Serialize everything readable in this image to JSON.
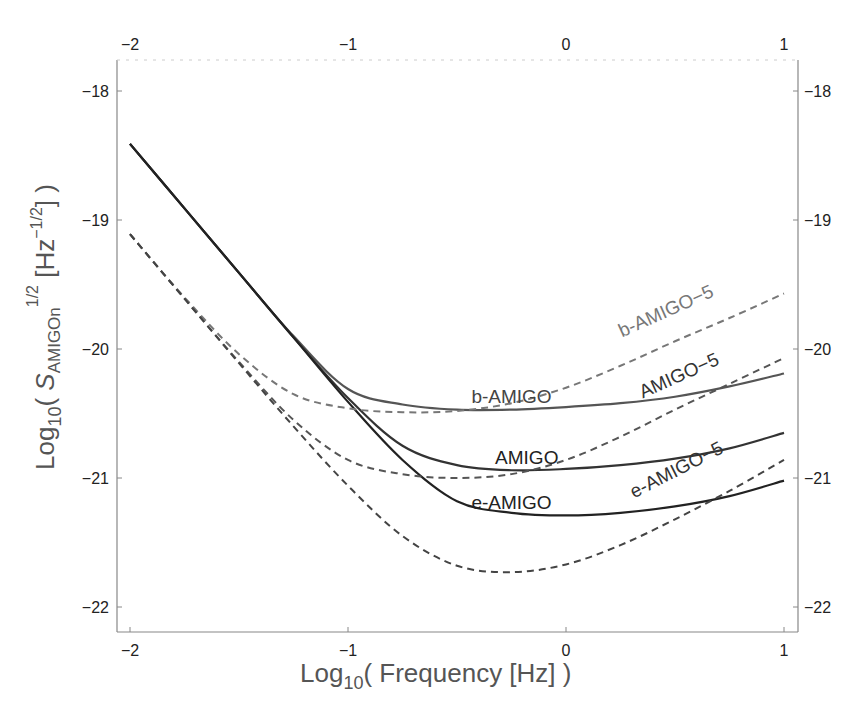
{
  "chart_data": {
    "type": "line",
    "title": "",
    "xlabel": "Log10( Frequency [Hz] )",
    "ylabel": "Log10( S_AMIGOn^1/2 [Hz^-1/2] )",
    "xlabel_parts": {
      "main": "Log",
      "sub": "10",
      "rest": "( Frequency [Hz] )"
    },
    "ylabel_parts": {
      "main": "Log",
      "sub": "10",
      "open": "( ",
      "s": "S",
      "s_sub": "AMIGOn",
      "s_sup": "1/2",
      "unit_open": " [Hz",
      "unit_sup": "−1/2",
      "close": "] )"
    },
    "xlim": [
      -2,
      1
    ],
    "ylim": [
      -22.2,
      -17.8
    ],
    "x_ticks": [
      -2,
      -1,
      0,
      1
    ],
    "x_tick_labels": [
      "−2",
      "−1",
      "0",
      "1"
    ],
    "y_ticks": [
      -18,
      -19,
      -20,
      -21,
      -22
    ],
    "y_tick_labels": [
      "−18",
      "−19",
      "−20",
      "−21",
      "−22"
    ],
    "grid": false,
    "legend": "inline labels",
    "x": [
      -2,
      -1.75,
      -1.5,
      -1.25,
      -1,
      -0.75,
      -0.5,
      -0.25,
      0,
      0.25,
      0.5,
      0.75,
      1
    ],
    "series": [
      {
        "name": "b-AMIGO",
        "style": "solid",
        "color": "#555555",
        "values": [
          -18.41,
          -18.91,
          -19.41,
          -19.9,
          -20.31,
          -20.43,
          -20.47,
          -20.47,
          -20.45,
          -20.42,
          -20.37,
          -20.29,
          -20.19
        ]
      },
      {
        "name": "AMIGO",
        "style": "solid",
        "color": "#333333",
        "values": [
          -18.41,
          -18.91,
          -19.41,
          -19.91,
          -20.38,
          -20.75,
          -20.9,
          -20.94,
          -20.93,
          -20.9,
          -20.85,
          -20.77,
          -20.65
        ]
      },
      {
        "name": "e-AMIGO",
        "style": "solid",
        "color": "#222222",
        "values": [
          -18.41,
          -18.91,
          -19.41,
          -19.91,
          -20.41,
          -20.86,
          -21.18,
          -21.27,
          -21.29,
          -21.27,
          -21.22,
          -21.14,
          -21.02
        ]
      },
      {
        "name": "b-AMIGO-5",
        "style": "dashed",
        "color": "#777777",
        "values": [
          -19.11,
          -19.6,
          -20.04,
          -20.35,
          -20.46,
          -20.49,
          -20.48,
          -20.42,
          -20.3,
          -20.13,
          -19.94,
          -19.76,
          -19.57
        ]
      },
      {
        "name": "AMIGO-5",
        "style": "dashed",
        "color": "#555555",
        "values": [
          -19.11,
          -19.61,
          -20.1,
          -20.55,
          -20.86,
          -20.97,
          -21.0,
          -20.97,
          -20.86,
          -20.68,
          -20.47,
          -20.27,
          -20.07
        ]
      },
      {
        "name": "e-AMIGO-5",
        "style": "dashed",
        "color": "#444444",
        "values": [
          -19.11,
          -19.61,
          -20.11,
          -20.6,
          -21.06,
          -21.45,
          -21.68,
          -21.73,
          -21.67,
          -21.52,
          -21.32,
          -21.1,
          -20.86
        ]
      }
    ],
    "annotations": [
      {
        "text": "b-AMIGO",
        "x": -0.25,
        "y": -20.42,
        "angle": 0,
        "color": "#444444"
      },
      {
        "text": "AMIGO",
        "x": -0.18,
        "y": -20.89,
        "angle": 0,
        "color": "#222222"
      },
      {
        "text": "e-AMIGO",
        "x": -0.25,
        "y": -21.24,
        "angle": 0,
        "color": "#222222"
      },
      {
        "text": "b-AMIGO−5",
        "x": 0.47,
        "y": -19.75,
        "angle": -24,
        "color": "#777777"
      },
      {
        "text": "AMIGO−5",
        "x": 0.53,
        "y": -20.25,
        "angle": -24,
        "color": "#333333"
      },
      {
        "text": "e-AMIGO−5",
        "x": 0.52,
        "y": -20.98,
        "angle": -27,
        "color": "#333333"
      }
    ]
  }
}
